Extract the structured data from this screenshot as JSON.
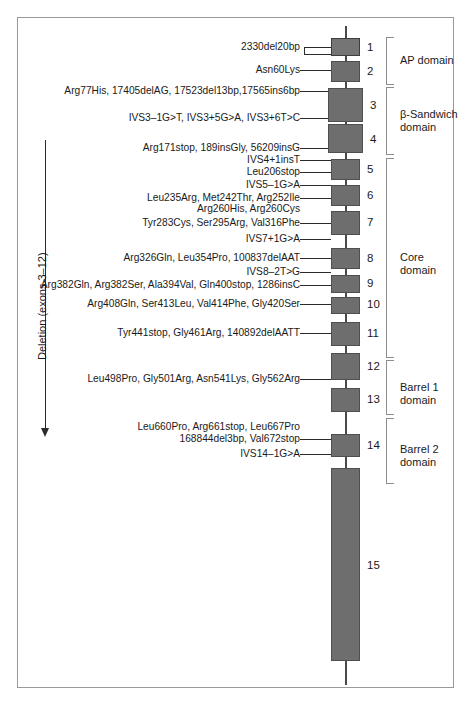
{
  "figure": {
    "colors": {
      "exon_fill": "#6e6e6e",
      "exon_stroke": "#4f4f4f",
      "intron": "#4a4a4a",
      "bracket": "#8d8d8d",
      "frame": "#9a9a9a",
      "text": "#1a1a1a",
      "background": "#ffffff"
    }
  },
  "deletion_annotation": {
    "label": "Deletion (exons 3–12)",
    "direction": "down",
    "icon": "down-arrow-icon"
  },
  "exons": [
    {
      "number": "1",
      "top": 38,
      "height": 18,
      "style": "hollow"
    },
    {
      "number": "2",
      "top": 61,
      "height": 21,
      "style": "solid"
    },
    {
      "number": "3",
      "top": 88,
      "height": 34,
      "style": "solid"
    },
    {
      "number": "4",
      "top": 124,
      "height": 29,
      "style": "solid"
    },
    {
      "number": "5",
      "top": 159,
      "height": 21,
      "style": "solid"
    },
    {
      "number": "6",
      "top": 185,
      "height": 21,
      "style": "solid"
    },
    {
      "number": "7",
      "top": 211,
      "height": 24,
      "style": "solid"
    },
    {
      "number": "8",
      "top": 248,
      "height": 21,
      "style": "solid"
    },
    {
      "number": "9",
      "top": 275,
      "height": 18,
      "style": "solid"
    },
    {
      "number": "10",
      "top": 297,
      "height": 17,
      "style": "solid"
    },
    {
      "number": "11",
      "top": 322,
      "height": 24,
      "style": "solid"
    },
    {
      "number": "12",
      "top": 353,
      "height": 27,
      "style": "solid"
    },
    {
      "number": "13",
      "top": 388,
      "height": 24,
      "style": "solid"
    },
    {
      "number": "14",
      "top": 434,
      "height": 23,
      "style": "solid"
    },
    {
      "number": "15",
      "top": 468,
      "height": 193,
      "style": "solid"
    }
  ],
  "mutations": [
    {
      "text": "2330del20bp",
      "exon": "1",
      "y": 44,
      "right": 300,
      "lines": 1
    },
    {
      "text": "Asn60Lys",
      "exon": "2",
      "y": 66,
      "right": 300,
      "lines": 1
    },
    {
      "text": "Arg77His, 17405delAG, 17523del13bp,17565ins6bp",
      "exon": "3",
      "y": 88,
      "right": 300,
      "lines": 1
    },
    {
      "text": "IVS3–1G>T, IVS3+5G>A, IVS3+6T>C",
      "exon": "3-4 boundary",
      "y": 115,
      "right": 300,
      "lines": 1
    },
    {
      "text": "Arg171stop, 189insGly, 56209insG",
      "exon": "4",
      "y": 145,
      "right": 300,
      "lines": 1
    },
    {
      "text": "IVS4+1insT",
      "exon": "4-5 boundary",
      "y": 157,
      "right": 300,
      "lines": 1
    },
    {
      "text": "Leu206stop",
      "exon": "5",
      "y": 170,
      "right": 300,
      "lines": 1
    },
    {
      "text": "IVS5–1G>A",
      "exon": "5-6 boundary",
      "y": 182,
      "right": 300,
      "lines": 1
    },
    {
      "text": "Leu235Arg, Met242Thr, Arg252Ile",
      "exon": "6",
      "y": 195,
      "right": 300,
      "lines": 1
    },
    {
      "text": "Arg260His, Arg260Cys",
      "exon": "6",
      "y": 206,
      "right": 300,
      "lines": 1
    },
    {
      "text": "Tyr283Cys, Ser295Arg, Val316Phe",
      "exon": "7",
      "y": 220,
      "right": 300,
      "lines": 1
    },
    {
      "text": "IVS7+1G>A",
      "exon": "7-8 boundary",
      "y": 236,
      "right": 300,
      "lines": 1
    },
    {
      "text": "Arg326Gln, Leu354Pro, 100837delAAT",
      "exon": "8",
      "y": 255,
      "right": 300,
      "lines": 1
    },
    {
      "text": "IVS8–2T>G",
      "exon": "8-9 boundary",
      "y": 269,
      "right": 300,
      "lines": 1
    },
    {
      "text": "Arg382Gln, Arg382Ser, Ala394Val, Gln400stop, 1286insC",
      "exon": "9",
      "y": 282,
      "right": 300,
      "lines": 1
    },
    {
      "text": "Arg408Gln, Ser413Leu, Val414Phe, Gly420Ser",
      "exon": "10",
      "y": 301,
      "right": 300,
      "lines": 1
    },
    {
      "text": "Tyr441stop, Gly461Arg, 140892delAATT",
      "exon": "11",
      "y": 330,
      "right": 300,
      "lines": 1
    },
    {
      "text": "Leu498Pro, Gly501Arg, Asn541Lys, Gly562Arg",
      "exon": "12",
      "y": 376,
      "right": 300,
      "lines": 1
    },
    {
      "text": "Leu660Pro, Arg661stop, Leu667Pro",
      "exon": "14",
      "y": 424,
      "right": 300,
      "lines": 1
    },
    {
      "text": "168844del3bp, Val672stop",
      "exon": "14",
      "y": 436,
      "right": 300,
      "lines": 1
    },
    {
      "text": "IVS14–1G>A",
      "exon": "14-15 boundary",
      "y": 451,
      "right": 300,
      "lines": 1
    }
  ],
  "domains": [
    {
      "name": "AP domain",
      "label_lines": [
        "AP domain"
      ],
      "top": 37,
      "height": 48,
      "exons": "1–2"
    },
    {
      "name": "β-Sandwich domain",
      "label_lines": [
        "β-Sandwich",
        "domain"
      ],
      "top": 87,
      "height": 68,
      "exons": "3–4"
    },
    {
      "name": "Core domain",
      "label_lines": [
        "Core",
        "domain"
      ],
      "top": 158,
      "height": 200,
      "exons": "5–12"
    },
    {
      "name": "Barrel 1 domain",
      "label_lines": [
        "Barrel 1",
        "domain"
      ],
      "top": 360,
      "height": 55,
      "exons": "12–13"
    },
    {
      "name": "Barrel 2 domain",
      "label_lines": [
        "Barrel 2",
        "domain"
      ],
      "top": 418,
      "height": 66,
      "exons": "14–15"
    }
  ]
}
